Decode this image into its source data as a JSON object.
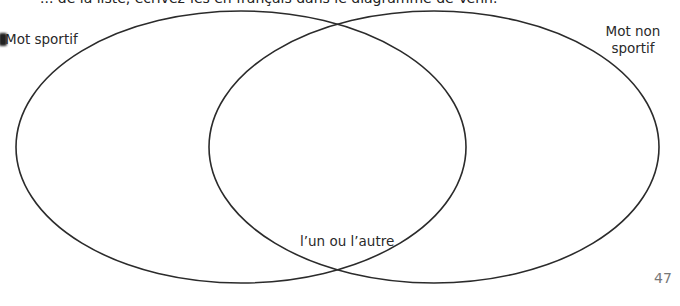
{
  "instruction_text": "... de la liste, écrivez-les en français dans le diagramme de Venn.",
  "venn": {
    "left_set": {
      "label": "Mot sportif"
    },
    "right_set": {
      "label_line1": "Mot non",
      "label_line2": "sportif"
    },
    "intersection": {
      "label": "l’un ou l’autre"
    },
    "stroke_color": "#2b2b2b"
  },
  "page_number": "47"
}
